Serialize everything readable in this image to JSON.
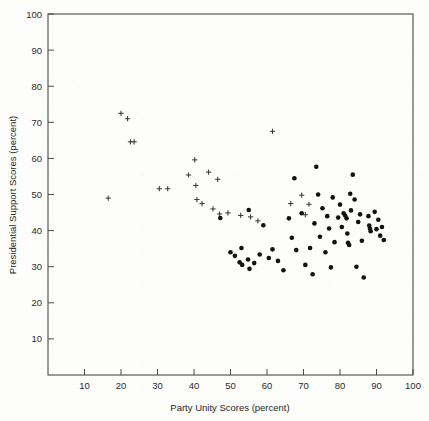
{
  "figure": {
    "background_color": "#fdfdfb",
    "width": 429,
    "height": 421
  },
  "chart_data": {
    "type": "scatter",
    "title": "",
    "xlabel": "Party Unity Scores (percent)",
    "ylabel": "Presidential Support Scores (percent)",
    "xlim": [
      0,
      100
    ],
    "ylim": [
      0,
      100
    ],
    "xticks": [
      10,
      20,
      30,
      40,
      50,
      60,
      70,
      80,
      90,
      100
    ],
    "yticks": [
      10,
      20,
      30,
      40,
      50,
      60,
      70,
      80,
      90,
      100
    ],
    "grid": false,
    "legend": "none",
    "frame": "box",
    "tick_direction": "in",
    "marker_colors": {
      "plus": "#3a3a3a",
      "dot": "#111111"
    },
    "series": [
      {
        "name": "plus-markers",
        "marker": "plus",
        "points": [
          [
            16.5,
            49.0
          ],
          [
            20.0,
            72.5
          ],
          [
            21.8,
            71.0
          ],
          [
            22.6,
            64.6
          ],
          [
            23.6,
            64.6
          ],
          [
            30.5,
            51.6
          ],
          [
            32.8,
            51.6
          ],
          [
            38.5,
            55.4
          ],
          [
            40.5,
            52.5
          ],
          [
            40.8,
            48.6
          ],
          [
            42.2,
            47.5
          ],
          [
            40.2,
            59.6
          ],
          [
            44.0,
            56.2
          ],
          [
            46.5,
            54.2
          ],
          [
            45.2,
            46.0
          ],
          [
            47.0,
            44.6
          ],
          [
            49.3,
            44.9
          ],
          [
            52.8,
            44.2
          ],
          [
            55.5,
            43.8
          ],
          [
            57.5,
            42.7
          ],
          [
            61.5,
            67.5
          ],
          [
            66.5,
            47.5
          ],
          [
            69.5,
            49.8
          ],
          [
            71.5,
            47.3
          ],
          [
            70.5,
            44.4
          ]
        ]
      },
      {
        "name": "dot-markers",
        "marker": "dot",
        "points": [
          [
            47.2,
            43.5
          ],
          [
            50.0,
            34.0
          ],
          [
            51.2,
            33.0
          ],
          [
            52.5,
            31.2
          ],
          [
            53.2,
            30.5
          ],
          [
            53.0,
            35.2
          ],
          [
            54.8,
            32.0
          ],
          [
            55.2,
            29.4
          ],
          [
            55.0,
            45.7
          ],
          [
            56.5,
            31.0
          ],
          [
            58.0,
            33.4
          ],
          [
            59.0,
            41.5
          ],
          [
            60.5,
            32.4
          ],
          [
            61.5,
            34.8
          ],
          [
            63.0,
            31.6
          ],
          [
            64.5,
            29.0
          ],
          [
            66.0,
            43.4
          ],
          [
            66.8,
            38.0
          ],
          [
            67.5,
            54.5
          ],
          [
            68.0,
            34.6
          ],
          [
            69.5,
            44.8
          ],
          [
            70.5,
            30.5
          ],
          [
            71.8,
            35.2
          ],
          [
            72.5,
            27.9
          ],
          [
            73.0,
            42.0
          ],
          [
            73.5,
            57.7
          ],
          [
            74.0,
            50.0
          ],
          [
            74.5,
            38.3
          ],
          [
            75.2,
            46.2
          ],
          [
            76.0,
            34.0
          ],
          [
            76.5,
            44.0
          ],
          [
            77.0,
            40.6
          ],
          [
            77.5,
            29.8
          ],
          [
            78.0,
            49.2
          ],
          [
            78.5,
            36.8
          ],
          [
            79.5,
            43.6
          ],
          [
            80.0,
            47.2
          ],
          [
            80.5,
            41.0
          ],
          [
            81.0,
            44.8
          ],
          [
            81.4,
            44.2
          ],
          [
            81.8,
            43.4
          ],
          [
            82.0,
            39.2
          ],
          [
            82.2,
            36.6
          ],
          [
            82.5,
            36.0
          ],
          [
            82.8,
            50.2
          ],
          [
            83.0,
            45.6
          ],
          [
            83.5,
            55.5
          ],
          [
            84.0,
            48.6
          ],
          [
            84.5,
            30.0
          ],
          [
            85.0,
            42.4
          ],
          [
            85.5,
            44.5
          ],
          [
            86.0,
            37.2
          ],
          [
            86.5,
            27.0
          ],
          [
            87.8,
            44.0
          ],
          [
            88.0,
            41.4
          ],
          [
            88.2,
            40.6
          ],
          [
            88.4,
            39.8
          ],
          [
            89.5,
            45.2
          ],
          [
            90.0,
            40.4
          ],
          [
            90.5,
            43.0
          ],
          [
            91.0,
            38.6
          ],
          [
            91.5,
            41.0
          ],
          [
            92.0,
            37.4
          ]
        ]
      }
    ]
  }
}
